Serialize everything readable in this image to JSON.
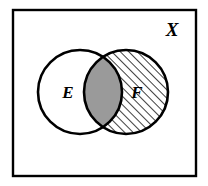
{
  "figure": {
    "kind": "venn-diagram",
    "width": 208,
    "height": 186,
    "background_color": "#ffffff",
    "stroke_color": "#000000",
    "labels": {
      "universe": "X",
      "left_set": "E",
      "right_set": "F"
    },
    "universe_rect": {
      "name": "universal-set-rectangle",
      "x": 13,
      "y": 10,
      "width": 183,
      "height": 166,
      "stroke_width": 2.4,
      "fill": "#ffffff"
    },
    "universe_label_pos": {
      "x": 172,
      "y": 36
    },
    "circles": [
      {
        "id": "left",
        "label": "E",
        "cx": 80,
        "cy": 92,
        "r": 42,
        "fill": "#ffffff",
        "stroke_width": 2.6,
        "label_pos": {
          "x": 68,
          "y": 98
        },
        "shading": "none"
      },
      {
        "id": "right",
        "label": "F",
        "cx": 126,
        "cy": 92,
        "r": 42,
        "fill": "hatch",
        "stroke_width": 2.6,
        "label_pos": {
          "x": 137,
          "y": 98
        },
        "shading": "diagonal-hatch"
      }
    ],
    "intersection": {
      "name": "intersection-lens",
      "fill_color": "#9a9a9a",
      "stroke_width": 2.6,
      "shading": "solid-gray"
    },
    "hatch": {
      "angle_degrees": 45,
      "spacing_px": 6,
      "line_width": 1.5,
      "color": "#000000"
    }
  }
}
